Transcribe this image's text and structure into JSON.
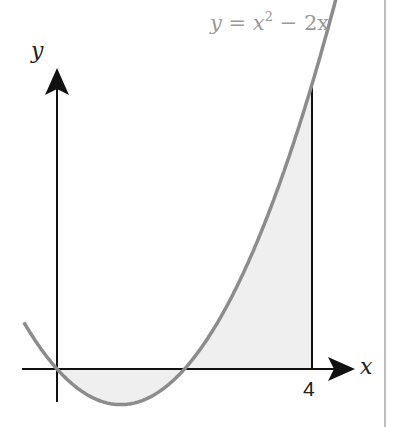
{
  "diagram": {
    "equation_label": "y = x² − 2x",
    "eq_parts": {
      "y": "y",
      "eq": " = ",
      "x": "x",
      "exp": "2",
      "rest": " − 2x"
    },
    "x_axis_label": "x",
    "y_axis_label": "y",
    "x_tick_label": "4",
    "colors": {
      "curve": "#8c8c8c",
      "shade": "#efefef",
      "axis": "#111111",
      "label": "#999999",
      "divider": "#bdbdbd"
    }
  }
}
